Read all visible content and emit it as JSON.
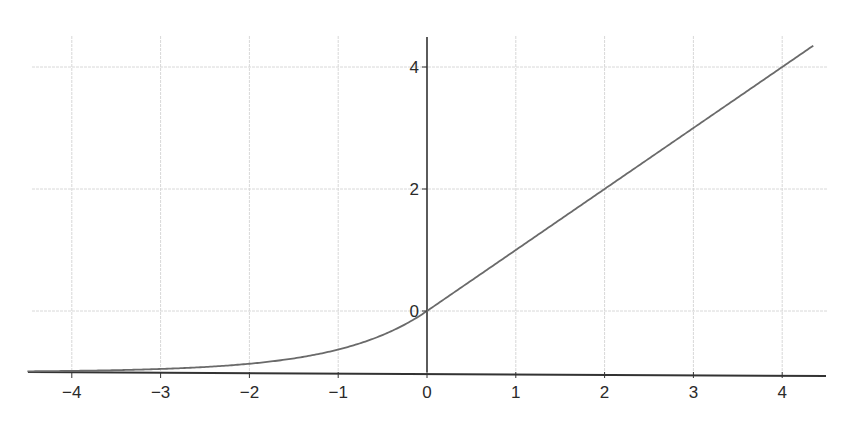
{
  "chart_data": {
    "type": "line",
    "title": "",
    "xlabel": "",
    "ylabel": "",
    "function": "ELU (alpha = 1): f(x) = x for x > 0, e^x - 1 for x <= 0",
    "xlim": [
      -4.5,
      4.5
    ],
    "ylim": [
      -1,
      4.5
    ],
    "grid": true,
    "legend": null,
    "x_ticks": [
      "−4",
      "−3",
      "−2",
      "−1",
      "0",
      "1",
      "2",
      "3",
      "4"
    ],
    "y_ticks": [
      "0",
      "2",
      "4"
    ],
    "series": [
      {
        "name": "ELU",
        "color": "#6a6a6a",
        "x": [
          -4.5,
          -4,
          -3,
          -2,
          -1.5,
          -1,
          -0.5,
          0,
          1,
          2,
          3,
          4,
          4.35
        ],
        "y": [
          -0.989,
          -0.982,
          -0.95,
          -0.865,
          -0.777,
          -0.632,
          -0.393,
          0,
          1,
          2,
          3,
          4,
          4.35
        ]
      }
    ]
  },
  "colors": {
    "axis": "#333333",
    "grid": "#d8d8d8",
    "curve": "#6a6a6a",
    "background": "#ffffff"
  }
}
